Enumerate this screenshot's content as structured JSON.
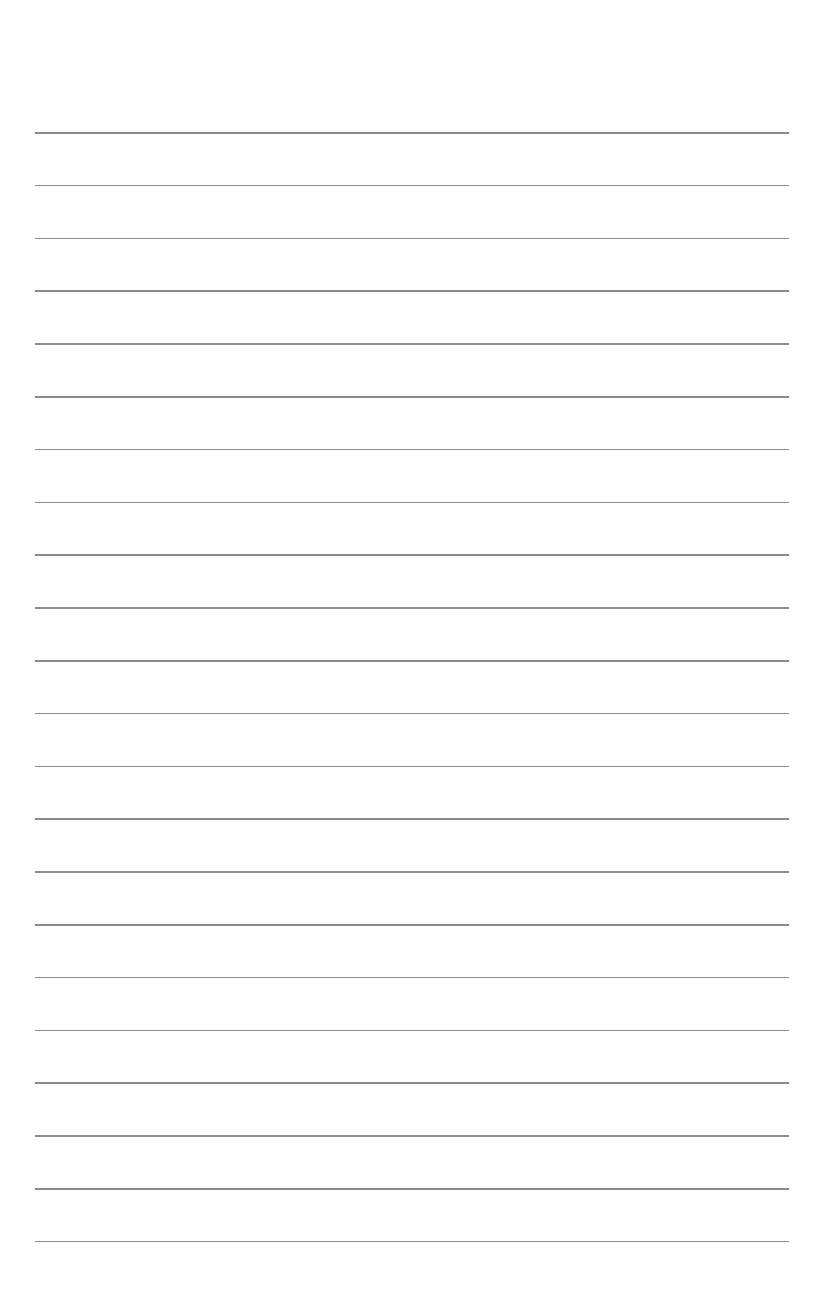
{
  "page": {
    "background": "#ffffff",
    "rule_color": "#8c8c8c",
    "rule_count": 22,
    "rule_first_y": 132,
    "rule_spacing": 52.8,
    "rule_left": 35,
    "rule_right": 789
  }
}
